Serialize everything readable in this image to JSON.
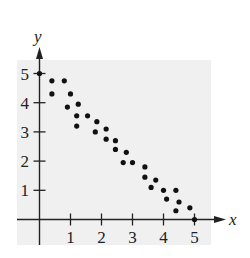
{
  "chart_data": {
    "type": "scatter",
    "title": "",
    "xlabel": "x",
    "ylabel": "y",
    "xlim": [
      0,
      5
    ],
    "ylim": [
      0,
      5
    ],
    "x_ticks": [
      "1",
      "2",
      "3",
      "4",
      "5"
    ],
    "y_ticks": [
      "1",
      "2",
      "3",
      "4",
      "5"
    ],
    "grid": false,
    "legend": null,
    "series": [
      {
        "name": "data",
        "points": [
          [
            0,
            5
          ],
          [
            0.4,
            4.75
          ],
          [
            0.8,
            4.75
          ],
          [
            0.4,
            4.3
          ],
          [
            1.0,
            4.3
          ],
          [
            0.9,
            3.85
          ],
          [
            1.25,
            3.95
          ],
          [
            1.2,
            3.55
          ],
          [
            1.55,
            3.55
          ],
          [
            1.2,
            3.2
          ],
          [
            1.85,
            3.35
          ],
          [
            1.8,
            3.0
          ],
          [
            2.15,
            3.1
          ],
          [
            2.15,
            2.75
          ],
          [
            2.45,
            2.7
          ],
          [
            2.45,
            2.4
          ],
          [
            2.8,
            2.3
          ],
          [
            2.7,
            1.95
          ],
          [
            3.0,
            1.95
          ],
          [
            3.4,
            1.8
          ],
          [
            3.4,
            1.45
          ],
          [
            3.75,
            1.35
          ],
          [
            3.6,
            1.1
          ],
          [
            4.0,
            1.0
          ],
          [
            4.4,
            1.0
          ],
          [
            4.1,
            0.7
          ],
          [
            4.5,
            0.6
          ],
          [
            4.4,
            0.3
          ],
          [
            4.85,
            0.4
          ],
          [
            5.0,
            0
          ]
        ]
      }
    ]
  },
  "colors": {
    "panel": "#f0f0f0",
    "axis": "#222222",
    "point": "#111111"
  }
}
